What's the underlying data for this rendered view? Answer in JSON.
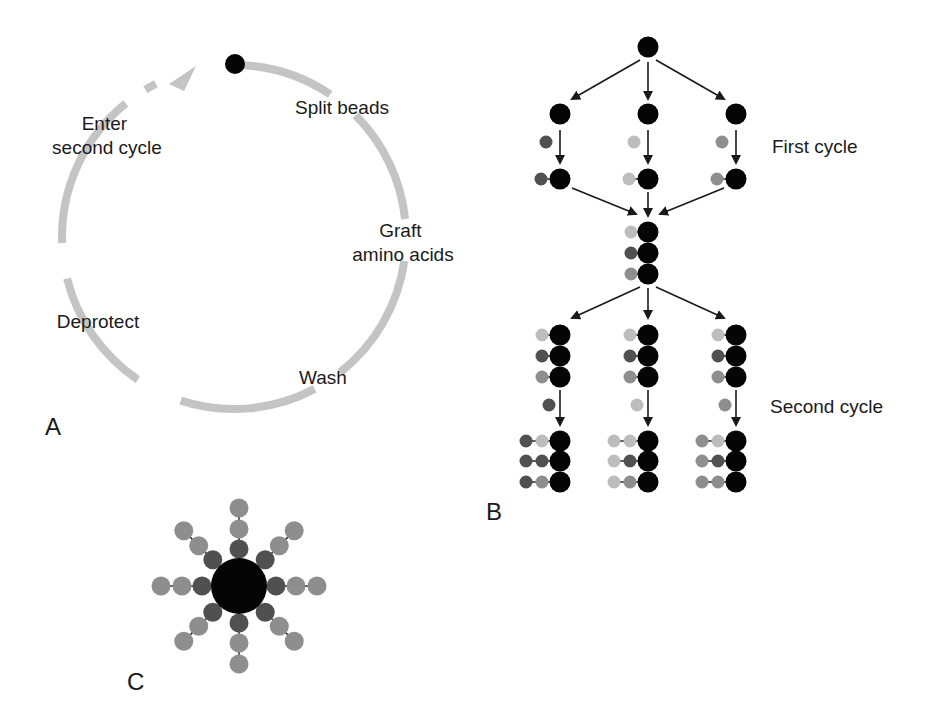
{
  "colors": {
    "bead": "#050505",
    "aa_dark": "#505050",
    "aa_light": "#bdbdbd",
    "aa_medium": "#8e8e8e",
    "cycle_arc": "#c4c4c4",
    "arrow": "#1a1a1a"
  },
  "panel_a": {
    "label": "A",
    "steps": [
      {
        "id": "split",
        "lines": [
          "Split beads"
        ]
      },
      {
        "id": "graft",
        "lines": [
          "Graft",
          "amino acids"
        ]
      },
      {
        "id": "wash",
        "lines": [
          "Wash"
        ]
      },
      {
        "id": "deprotect",
        "lines": [
          "Deprotect"
        ]
      },
      {
        "id": "enter",
        "lines": [
          "Enter",
          "second cycle"
        ]
      }
    ]
  },
  "panel_b": {
    "label": "B",
    "first_cycle_label": "First cycle",
    "second_cycle_label": "Second cycle",
    "columns": [
      {
        "position": "left",
        "amino_acid": "dark"
      },
      {
        "position": "middle",
        "amino_acid": "light"
      },
      {
        "position": "right",
        "amino_acid": "medium"
      }
    ],
    "pooled_stack": [
      "light",
      "dark",
      "medium"
    ],
    "final_stacks": [
      [
        [
          "dark",
          "light"
        ],
        [
          "dark",
          "dark"
        ],
        [
          "dark",
          "medium"
        ]
      ],
      [
        [
          "light",
          "light"
        ],
        [
          "light",
          "dark"
        ],
        [
          "light",
          "medium"
        ]
      ],
      [
        [
          "medium",
          "light"
        ],
        [
          "medium",
          "dark"
        ],
        [
          "medium",
          "medium"
        ]
      ]
    ]
  },
  "panel_c": {
    "label": "C",
    "arms": 8,
    "chain": [
      "dark",
      "medium",
      "medium"
    ]
  }
}
